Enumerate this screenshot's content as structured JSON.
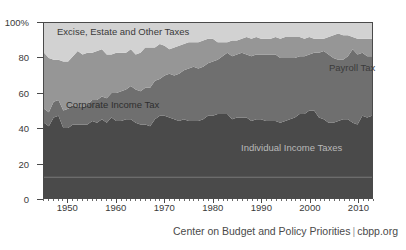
{
  "chart_data": {
    "type": "area",
    "stacked": true,
    "normalized": true,
    "title": "",
    "subtitle": "",
    "xlabel": "",
    "ylabel": "",
    "xlim": [
      1945,
      2013
    ],
    "ylim": [
      0,
      100
    ],
    "grid": false,
    "legend_position": "in-plot-annotations",
    "y_ticks": [
      {
        "value": 0,
        "label": "0"
      },
      {
        "value": 20,
        "label": "20"
      },
      {
        "value": 40,
        "label": "40"
      },
      {
        "value": 60,
        "label": "60"
      },
      {
        "value": 80,
        "label": "80"
      },
      {
        "value": 100,
        "label": "100%"
      }
    ],
    "x_ticks": [
      {
        "value": 1950,
        "label": "1950"
      },
      {
        "value": 1960,
        "label": "1960"
      },
      {
        "value": 1970,
        "label": "1970"
      },
      {
        "value": 1980,
        "label": "1980"
      },
      {
        "value": 1990,
        "label": "1990"
      },
      {
        "value": 2000,
        "label": "2000"
      },
      {
        "value": 2010,
        "label": "2010"
      }
    ],
    "x": [
      1945,
      1946,
      1947,
      1948,
      1949,
      1950,
      1951,
      1952,
      1953,
      1954,
      1955,
      1956,
      1957,
      1958,
      1959,
      1960,
      1961,
      1962,
      1963,
      1964,
      1965,
      1966,
      1967,
      1968,
      1969,
      1970,
      1971,
      1972,
      1973,
      1974,
      1975,
      1976,
      1977,
      1978,
      1979,
      1980,
      1981,
      1982,
      1983,
      1984,
      1985,
      1986,
      1987,
      1988,
      1989,
      1990,
      1991,
      1992,
      1993,
      1994,
      1995,
      1996,
      1997,
      1998,
      1999,
      2000,
      2001,
      2002,
      2003,
      2004,
      2005,
      2006,
      2007,
      2008,
      2009,
      2010,
      2011,
      2012,
      2013
    ],
    "series": [
      {
        "name": "Individual Income Taxes",
        "color": "#4a4a4a",
        "order": 1,
        "values": [
          43,
          41,
          46,
          47,
          40,
          40,
          42,
          42,
          42,
          42,
          44,
          43,
          45,
          43,
          46,
          44,
          44,
          45,
          45,
          43,
          42,
          42,
          41,
          45,
          47,
          47,
          46,
          45,
          44,
          45,
          44,
          44,
          44,
          45,
          47,
          47,
          48,
          48,
          48,
          45,
          46,
          46,
          46,
          44,
          45,
          45,
          44,
          44,
          44,
          43,
          44,
          45,
          46,
          48,
          48,
          50,
          50,
          46,
          45,
          43,
          43,
          44,
          45,
          45,
          43,
          42,
          47,
          46,
          47
        ]
      },
      {
        "name": "Payroll Tax",
        "color": "#6f6f6f",
        "order": 2,
        "values": [
          8,
          8,
          9,
          9,
          10,
          11,
          11,
          10,
          10,
          11,
          12,
          13,
          13,
          14,
          14,
          16,
          17,
          17,
          19,
          19,
          19,
          21,
          22,
          22,
          21,
          23,
          25,
          25,
          27,
          28,
          30,
          31,
          30,
          30,
          30,
          31,
          31,
          33,
          35,
          36,
          36,
          37,
          36,
          37,
          37,
          37,
          38,
          38,
          38,
          37,
          36,
          35,
          34,
          33,
          33,
          32,
          33,
          37,
          39,
          39,
          37,
          35,
          34,
          36,
          42,
          40,
          36,
          35,
          34
        ]
      },
      {
        "name": "Corporate Income Tax",
        "color": "#969696",
        "order": 3,
        "values": [
          32,
          31,
          24,
          23,
          28,
          27,
          28,
          32,
          30,
          30,
          27,
          28,
          27,
          25,
          22,
          23,
          22,
          21,
          21,
          20,
          22,
          23,
          23,
          19,
          20,
          17,
          14,
          16,
          16,
          15,
          15,
          14,
          15,
          15,
          14,
          13,
          10,
          8,
          6,
          9,
          8,
          8,
          10,
          10,
          10,
          9,
          9,
          9,
          10,
          11,
          12,
          12,
          12,
          11,
          10,
          10,
          8,
          8,
          7,
          10,
          13,
          15,
          14,
          12,
          7,
          9,
          8,
          10,
          10
        ]
      },
      {
        "name": "Excise, Estate and Other Taxes",
        "color": "#d2d2d2",
        "order": 4,
        "values": [
          17,
          20,
          21,
          21,
          22,
          22,
          19,
          16,
          18,
          17,
          17,
          16,
          15,
          18,
          18,
          17,
          17,
          17,
          15,
          18,
          17,
          14,
          14,
          14,
          12,
          13,
          15,
          14,
          13,
          12,
          11,
          11,
          11,
          10,
          9,
          9,
          11,
          11,
          11,
          10,
          10,
          9,
          8,
          9,
          8,
          9,
          9,
          9,
          8,
          9,
          8,
          8,
          8,
          8,
          9,
          8,
          9,
          9,
          9,
          8,
          7,
          6,
          7,
          7,
          8,
          9,
          9,
          9,
          9
        ]
      }
    ],
    "annotations": [
      {
        "name": "excise-label",
        "text": "Excise, Estate and Other Taxes"
      },
      {
        "name": "payroll-label",
        "text": "Payroll Tax"
      },
      {
        "name": "corporate-label",
        "text": "Corporate Income Tax"
      },
      {
        "name": "individual-label",
        "text": "Individual Income Taxes"
      }
    ]
  },
  "caption": {
    "organization": "Center on Budget and Policy Priorities",
    "separator": "|",
    "website": "cbpp.org"
  },
  "colors": {
    "individual": "#4a4a4a",
    "payroll": "#6f6f6f",
    "corporate": "#969696",
    "excise": "#d2d2d2",
    "axis": "#4a4a4a",
    "background": "#ffffff"
  }
}
